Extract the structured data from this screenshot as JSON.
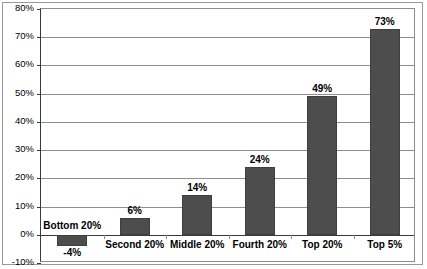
{
  "chart_data": {
    "type": "bar",
    "title": "",
    "xlabel": "",
    "ylabel": "",
    "categories": [
      "Bottom 20%",
      "Second 20%",
      "Middle 20%",
      "Fourth 20%",
      "Top 20%",
      "Top 5%"
    ],
    "values": [
      -4,
      6,
      14,
      24,
      49,
      73
    ],
    "value_labels": [
      "-4%",
      "6%",
      "14%",
      "24%",
      "49%",
      "73%"
    ],
    "ylim": [
      -10,
      80
    ],
    "ytick_values": [
      80,
      70,
      60,
      50,
      40,
      30,
      20,
      10,
      0,
      -10
    ],
    "ytick_labels": [
      "80%",
      "70%",
      "60%",
      "50%",
      "40%",
      "30%",
      "20%",
      "10%",
      "0%",
      "-10%"
    ],
    "grid": true,
    "legend": "none",
    "series": [
      {
        "name": "",
        "values": [
          -4,
          6,
          14,
          24,
          49,
          73
        ]
      }
    ],
    "colors": {
      "bar_fill": "#4d4d4d",
      "bar_stroke": "#3f3f3f",
      "gridline": "#8e8e8e",
      "axis": "#3a3a3a",
      "frame": "#9a9a9a",
      "text": "#000000",
      "background": "#ffffff"
    }
  }
}
